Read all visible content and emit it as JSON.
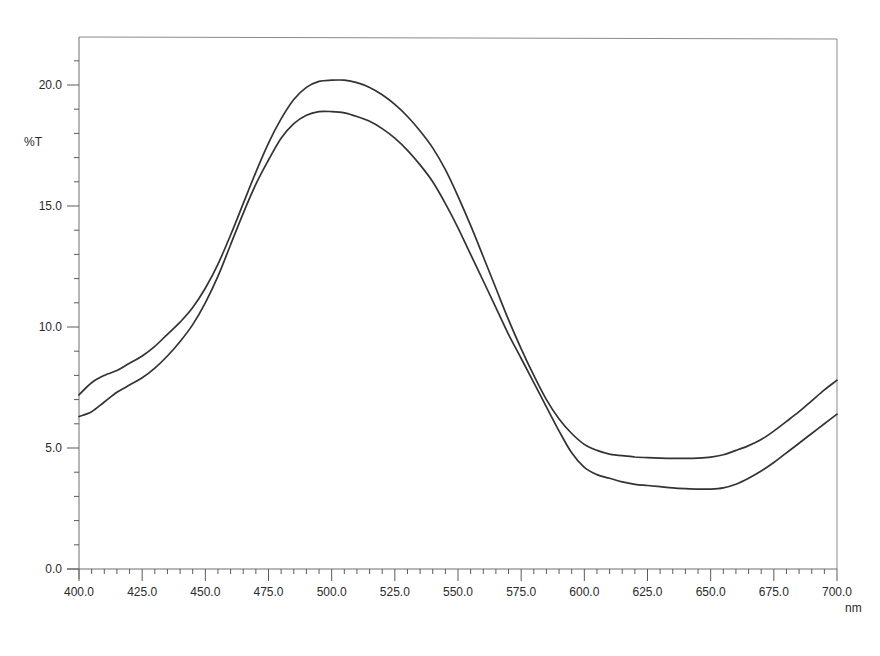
{
  "chart_data": {
    "type": "line",
    "title": "",
    "xlabel": "nm",
    "ylabel": "%T",
    "xlim": [
      400,
      700
    ],
    "ylim": [
      0,
      22
    ],
    "grid": false,
    "legend": "none",
    "x_ticks": [
      "400.0",
      "425.0",
      "450.0",
      "475.0",
      "500.0",
      "525.0",
      "550.0",
      "575.0",
      "600.0",
      "625.0",
      "650.0",
      "675.0",
      "700.0"
    ],
    "x_tick_values": [
      400,
      425,
      450,
      475,
      500,
      525,
      550,
      575,
      600,
      625,
      650,
      675,
      700
    ],
    "x_minor_step": 5,
    "y_ticks": [
      "0.0",
      "5.0",
      "10.0",
      "15.0",
      "20.0"
    ],
    "y_tick_values": [
      0,
      5,
      10,
      15,
      20
    ],
    "y_minor_step": 1,
    "x": [
      400,
      405,
      410,
      415,
      420,
      425,
      430,
      435,
      440,
      445,
      450,
      455,
      460,
      465,
      470,
      475,
      480,
      485,
      490,
      495,
      500,
      505,
      510,
      515,
      520,
      525,
      530,
      535,
      540,
      545,
      550,
      555,
      560,
      565,
      570,
      575,
      580,
      585,
      590,
      595,
      600,
      605,
      610,
      615,
      620,
      625,
      630,
      635,
      640,
      645,
      650,
      655,
      660,
      665,
      670,
      675,
      680,
      685,
      690,
      695,
      700
    ],
    "series": [
      {
        "name": "Spectrum A",
        "values": [
          7.2,
          7.7,
          8.0,
          8.2,
          8.5,
          8.8,
          9.2,
          9.7,
          10.2,
          10.8,
          11.6,
          12.6,
          13.8,
          15.1,
          16.4,
          17.6,
          18.6,
          19.4,
          19.9,
          20.15,
          20.2,
          20.2,
          20.1,
          19.9,
          19.6,
          19.2,
          18.7,
          18.1,
          17.4,
          16.5,
          15.4,
          14.2,
          12.9,
          11.6,
          10.3,
          9.1,
          8.0,
          7.0,
          6.2,
          5.6,
          5.15,
          4.9,
          4.75,
          4.68,
          4.63,
          4.6,
          4.58,
          4.57,
          4.57,
          4.58,
          4.62,
          4.72,
          4.9,
          5.1,
          5.35,
          5.7,
          6.1,
          6.5,
          6.95,
          7.4,
          7.8
        ]
      },
      {
        "name": "Spectrum B",
        "values": [
          6.3,
          6.5,
          6.9,
          7.3,
          7.6,
          7.9,
          8.3,
          8.8,
          9.4,
          10.1,
          11.0,
          12.1,
          13.4,
          14.7,
          15.9,
          16.9,
          17.8,
          18.4,
          18.75,
          18.9,
          18.9,
          18.85,
          18.7,
          18.5,
          18.2,
          17.8,
          17.3,
          16.7,
          16.0,
          15.1,
          14.1,
          13.0,
          11.9,
          10.8,
          9.7,
          8.7,
          7.7,
          6.7,
          5.7,
          4.8,
          4.2,
          3.9,
          3.75,
          3.6,
          3.5,
          3.45,
          3.4,
          3.35,
          3.32,
          3.3,
          3.3,
          3.35,
          3.5,
          3.75,
          4.05,
          4.4,
          4.8,
          5.2,
          5.6,
          6.0,
          6.4
        ]
      }
    ]
  }
}
